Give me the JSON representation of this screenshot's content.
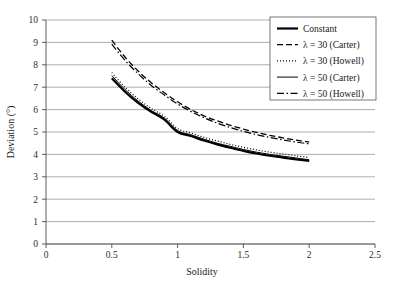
{
  "chart_data": {
    "type": "line",
    "title": "",
    "xlabel": "Solidity",
    "ylabel": "Deviation (°)",
    "xlim": [
      0,
      2.5
    ],
    "ylim": [
      0,
      10
    ],
    "xticks": [
      "0",
      "0.5",
      "1",
      "1.5",
      "2",
      "2.5"
    ],
    "xtick_values": [
      0,
      0.5,
      1,
      1.5,
      2,
      2.5
    ],
    "yticks": [
      "0",
      "1",
      "2",
      "3",
      "4",
      "5",
      "6",
      "7",
      "8",
      "9",
      "10"
    ],
    "ytick_values": [
      0,
      1,
      2,
      3,
      4,
      5,
      6,
      7,
      8,
      9,
      10
    ],
    "grid": "horizontal",
    "legend_position": "top-right",
    "x": [
      0.5,
      0.6,
      0.7,
      0.8,
      0.9,
      1.0,
      1.1,
      1.2,
      1.3,
      1.4,
      1.5,
      1.6,
      1.7,
      1.8,
      1.9,
      2.0
    ],
    "series": [
      {
        "name": "Constant",
        "style": "solid-thick",
        "values": [
          7.4,
          6.8,
          6.3,
          5.9,
          5.55,
          5.0,
          4.82,
          4.62,
          4.45,
          4.3,
          4.16,
          4.04,
          3.94,
          3.86,
          3.78,
          3.71
        ]
      },
      {
        "name": "λ = 30 (Carter)",
        "style": "dashed",
        "values": [
          9.1,
          8.35,
          7.72,
          7.2,
          6.75,
          6.35,
          6.0,
          5.72,
          5.5,
          5.3,
          5.13,
          4.98,
          4.85,
          4.74,
          4.64,
          4.55
        ]
      },
      {
        "name": "λ = 30 (Howell)",
        "style": "dotted",
        "values": [
          7.65,
          7.0,
          6.48,
          6.05,
          5.7,
          5.15,
          4.96,
          4.76,
          4.6,
          4.45,
          4.32,
          4.2,
          4.1,
          4.02,
          3.94,
          3.86
        ]
      },
      {
        "name": "λ = 50 (Carter)",
        "style": "solid-thin",
        "values": [
          7.52,
          6.9,
          6.38,
          5.96,
          5.62,
          5.06,
          4.88,
          4.68,
          4.5,
          4.36,
          4.22,
          4.1,
          4.0,
          3.92,
          3.84,
          3.76
        ]
      },
      {
        "name": "λ = 50 (Howell)",
        "style": "dashdot",
        "values": [
          8.92,
          8.2,
          7.6,
          7.08,
          6.65,
          6.25,
          5.92,
          5.64,
          5.4,
          5.2,
          5.03,
          4.88,
          4.76,
          4.65,
          4.55,
          4.47
        ]
      }
    ]
  },
  "legend": {
    "entries": [
      {
        "label": "Constant"
      },
      {
        "label": "λ = 30 (Carter)"
      },
      {
        "label": "λ = 30 (Howell)"
      },
      {
        "label": "λ = 50 (Carter)"
      },
      {
        "label": "λ = 50 (Howell)"
      }
    ]
  }
}
